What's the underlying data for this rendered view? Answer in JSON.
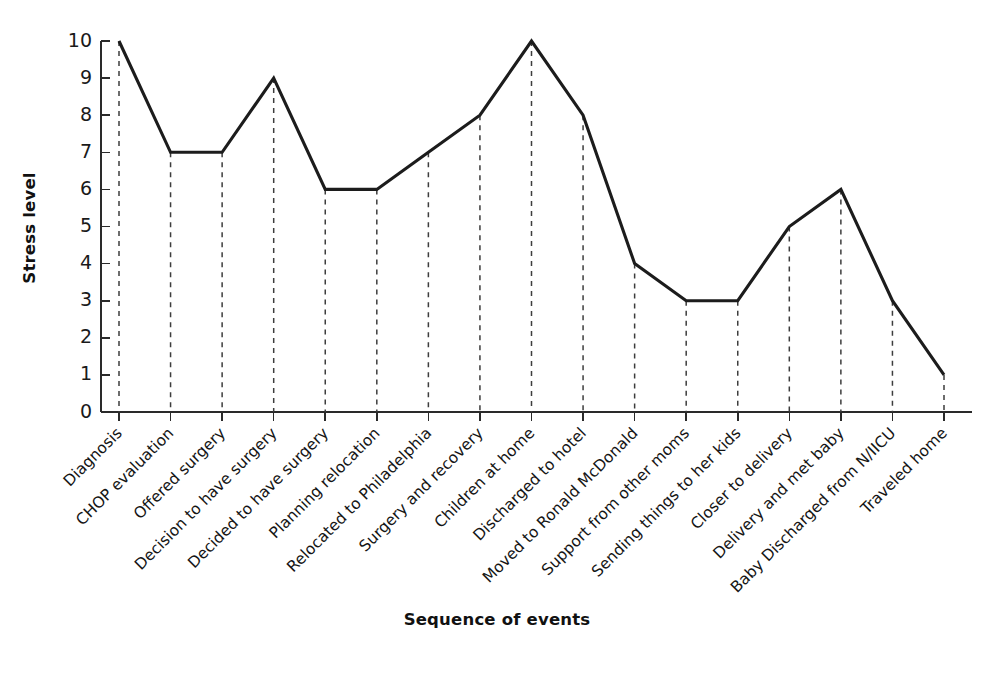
{
  "chart_data": {
    "type": "line",
    "title": "",
    "xlabel": "Sequence of events",
    "ylabel": "Stress level",
    "ylim": [
      0,
      10
    ],
    "yticks": [
      0,
      1,
      2,
      3,
      4,
      5,
      6,
      7,
      8,
      9,
      10
    ],
    "ytick_labels": [
      "0",
      "1",
      "2",
      "3",
      "4",
      "5",
      "6",
      "7",
      "8",
      "9",
      "10"
    ],
    "grid": false,
    "legend": null,
    "legend_position": "none",
    "line_color": "#1c1c1c",
    "dropline_color": "#3d3d3d",
    "background_color": "#ffffff",
    "categories": [
      "Diagnosis",
      "CHOP evaluation",
      "Offered surgery",
      "Decision to have surgery",
      "Decided to have surgery",
      "Planning relocation",
      "Relocated to Philadelphia",
      "Surgery and recovery",
      "Children at home",
      "Discharged to hotel",
      "Moved to Ronald McDonald",
      "Support from other moms",
      "Sending things to her kids",
      "Closer to delivery",
      "Delivery and met baby",
      "Baby Discharged from N/IICU",
      "Traveled home"
    ],
    "values": [
      10,
      7,
      7,
      9,
      6,
      6,
      7,
      8,
      10,
      8,
      4,
      3,
      3,
      5,
      6,
      3,
      1
    ],
    "series": [
      {
        "name": "Stress level",
        "values": [
          10,
          7,
          7,
          9,
          6,
          6,
          7,
          8,
          10,
          8,
          4,
          3,
          3,
          5,
          6,
          3,
          1
        ]
      }
    ]
  },
  "axes": {
    "y_title": "Stress level",
    "x_title": "Sequence of events"
  }
}
